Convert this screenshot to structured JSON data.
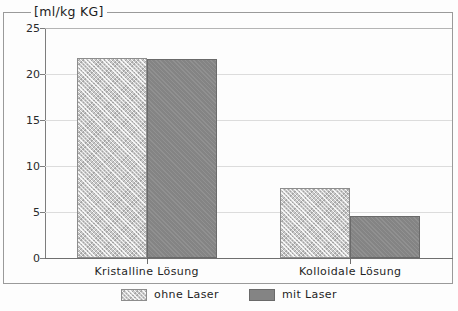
{
  "chart_data": {
    "type": "bar",
    "title": "[ml/kg KG]",
    "xlabel": "",
    "ylabel": "",
    "ylim": [
      0,
      25
    ],
    "yticks": [
      "0",
      "5",
      "10",
      "15",
      "20",
      "25"
    ],
    "grid": true,
    "legend_position": "bottom-center",
    "categories": [
      "Kristalline Lösung",
      "Kolloidale Lösung"
    ],
    "series": [
      {
        "name": "ohne Laser",
        "values": [
          21.7,
          7.6
        ],
        "color": "#c9c9c9",
        "pattern": "cross-hatch"
      },
      {
        "name": "mit Laser",
        "values": [
          21.6,
          4.6
        ],
        "color": "#848484",
        "pattern": "solid"
      }
    ]
  },
  "legend": {
    "items": [
      {
        "label": "ohne Laser"
      },
      {
        "label": "mit Laser"
      }
    ]
  }
}
